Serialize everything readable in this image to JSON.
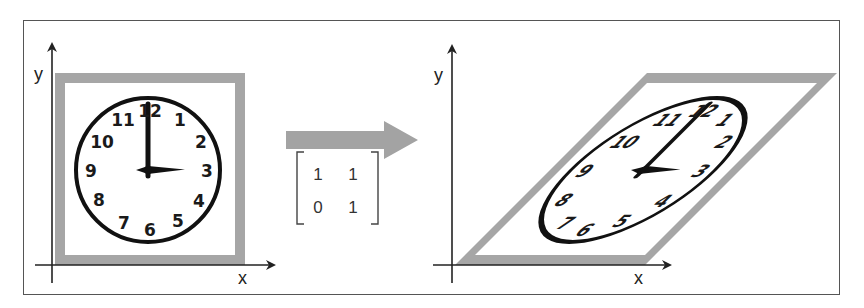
{
  "figure": {
    "colors": {
      "frame": "#555555",
      "axis": "#222222",
      "square_border": "#a6a6a6",
      "arrow": "#a3a3a3",
      "clock": "#111111"
    },
    "left_panel": {
      "axis_labels": {
        "x": "x",
        "y": "y"
      },
      "clock": {
        "numbers": [
          "12",
          "1",
          "2",
          "3",
          "4",
          "5",
          "6",
          "7",
          "8",
          "9",
          "10",
          "11"
        ],
        "time_shown": "3:00"
      }
    },
    "transform": {
      "arrow": "right-arrow",
      "matrix": {
        "rows": [
          [
            "1",
            "1"
          ],
          [
            "0",
            "1"
          ]
        ]
      }
    },
    "right_panel": {
      "axis_labels": {
        "x": "x",
        "y": "y"
      },
      "description": "sheared clock (parallelogram)"
    }
  }
}
